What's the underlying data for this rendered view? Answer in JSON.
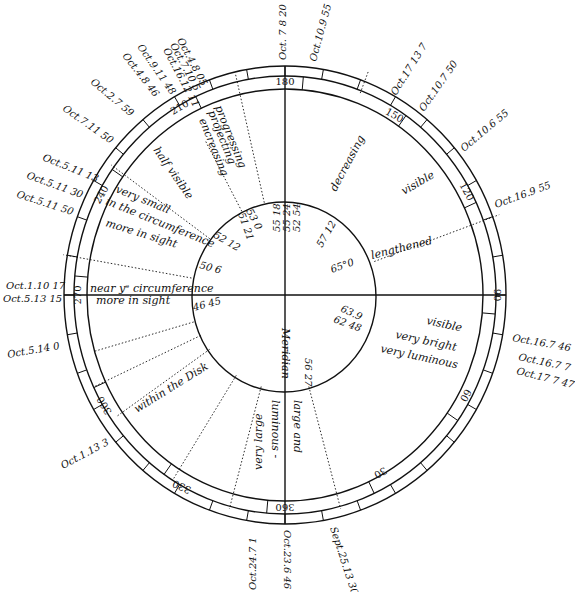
{
  "diagram": {
    "type": "circular observation chart",
    "colors": {
      "ink": "#111111",
      "background": "#ffffff"
    },
    "degree_marks": [
      {
        "label": "180",
        "x": 285,
        "y": 82,
        "rot": 0
      },
      {
        "label": "150",
        "x": 394,
        "y": 116,
        "rot": 30
      },
      {
        "label": "120",
        "x": 466,
        "y": 192,
        "rot": 62
      },
      {
        "label": "90",
        "x": 496,
        "y": 295,
        "rot": 90
      },
      {
        "label": "60",
        "x": 465,
        "y": 395,
        "rot": 118
      },
      {
        "label": "30",
        "x": 380,
        "y": 472,
        "rot": 150
      },
      {
        "label": "360",
        "x": 285,
        "y": 506,
        "rot": 180
      },
      {
        "label": "330",
        "x": 182,
        "y": 486,
        "rot": 205
      },
      {
        "label": "300",
        "x": 105,
        "y": 405,
        "rot": 240
      },
      {
        "label": "270",
        "x": 78,
        "y": 295,
        "rot": 270
      },
      {
        "label": "240",
        "x": 102,
        "y": 195,
        "rot": 300
      },
      {
        "label": "210",
        "x": 180,
        "y": 108,
        "rot": 330
      }
    ],
    "outer_dates": [
      {
        "text": "Oct. 7 8 20",
        "x": 286,
        "y": 60,
        "rot": -90
      },
      {
        "text": "Oct.10.9 55",
        "x": 316,
        "y": 62,
        "rot": -75
      },
      {
        "text": "Oct.17 13 7",
        "x": 396,
        "y": 96,
        "rot": -58
      },
      {
        "text": "Oct.10.7 50",
        "x": 424,
        "y": 112,
        "rot": -55
      },
      {
        "text": "Oct.10.6 55",
        "x": 464,
        "y": 152,
        "rot": -40
      },
      {
        "text": "Oct.16.9 55",
        "x": 496,
        "y": 208,
        "rot": -20
      },
      {
        "text": "Oct.16.7 46",
        "x": 512,
        "y": 341,
        "rot": 10
      },
      {
        "text": "Oct.16.7 7",
        "x": 518,
        "y": 360,
        "rot": 12
      },
      {
        "text": "Oct.17 7 47",
        "x": 516,
        "y": 374,
        "rot": 14
      },
      {
        "text": "Sept.25.13 30",
        "x": 330,
        "y": 528,
        "rot": 72
      },
      {
        "text": "Oct.23.6 46",
        "x": 284,
        "y": 530,
        "rot": 90
      },
      {
        "text": "Oct.24.7 1",
        "x": 256,
        "y": 590,
        "rot": -90
      },
      {
        "text": "Oct.1.13 3",
        "x": 63,
        "y": 469,
        "rot": -28
      },
      {
        "text": "Oct.5.14 0",
        "x": 8,
        "y": 358,
        "rot": -10
      },
      {
        "text": "Oct.5.13 15",
        "x": 3,
        "y": 302,
        "rot": 0
      },
      {
        "text": "Oct.1.10 17",
        "x": 6,
        "y": 289,
        "rot": 0
      },
      {
        "text": "Oct.5.11 50",
        "x": 16,
        "y": 197,
        "rot": 18
      },
      {
        "text": "Oct.5.11 30",
        "x": 26,
        "y": 178,
        "rot": 20
      },
      {
        "text": "Oct.5.11 13",
        "x": 42,
        "y": 160,
        "rot": 22
      },
      {
        "text": "Oct.7.11 50",
        "x": 62,
        "y": 110,
        "rot": 35
      },
      {
        "text": "Oct.2.7 59",
        "x": 90,
        "y": 83,
        "rot": 40
      },
      {
        "text": "Oct.4.8 46",
        "x": 122,
        "y": 56,
        "rot": 52
      },
      {
        "text": "Oct.9.11 48",
        "x": 137,
        "y": 47,
        "rot": 55
      },
      {
        "text": "Oct.4.8 05",
        "x": 177,
        "y": 40,
        "rot": 62
      },
      {
        "text": "Oct.7.10 5",
        "x": 170,
        "y": 45,
        "rot": 62
      },
      {
        "text": "Oct.16.12 11",
        "x": 163,
        "y": 50,
        "rot": 62
      }
    ],
    "inner_values": [
      {
        "text": "55 18",
        "x": 280,
        "y": 232,
        "rot": -90
      },
      {
        "text": "55 24",
        "x": 290,
        "y": 232,
        "rot": -90
      },
      {
        "text": "52 54",
        "x": 300,
        "y": 232,
        "rot": -90
      },
      {
        "text": "53 0",
        "x": 246,
        "y": 211,
        "rot": 62
      },
      {
        "text": "51 21",
        "x": 238,
        "y": 214,
        "rot": 70
      },
      {
        "text": "52 12",
        "x": 213,
        "y": 237,
        "rot": 30
      },
      {
        "text": "50 6",
        "x": 199,
        "y": 268,
        "rot": 15
      },
      {
        "text": "57 12",
        "x": 322,
        "y": 248,
        "rot": -60
      },
      {
        "text": "65°0",
        "x": 332,
        "y": 273,
        "rot": -20
      },
      {
        "text": "63.9",
        "x": 340,
        "y": 311,
        "rot": 25
      },
      {
        "text": "62 48",
        "x": 333,
        "y": 322,
        "rot": 20
      },
      {
        "text": "56 27",
        "x": 305,
        "y": 358,
        "rot": 90
      },
      {
        "text": "46 45",
        "x": 194,
        "y": 311,
        "rot": -15
      }
    ],
    "notes": [
      {
        "text": "progressing",
        "x": 215,
        "y": 107,
        "rot": 68
      },
      {
        "text": "projecting",
        "x": 208,
        "y": 112,
        "rot": 68
      },
      {
        "text": "encreasing",
        "x": 199,
        "y": 120,
        "rot": 68
      },
      {
        "text": "half visible",
        "x": 153,
        "y": 150,
        "rot": 55
      },
      {
        "text": "decreasing",
        "x": 336,
        "y": 192,
        "rot": -62
      },
      {
        "text": "visible",
        "x": 404,
        "y": 195,
        "rot": -30
      },
      {
        "text": "lengthened",
        "x": 372,
        "y": 259,
        "rot": -14
      },
      {
        "text": "very small",
        "x": 115,
        "y": 192,
        "rot": 22
      },
      {
        "text": "in the circumference",
        "x": 105,
        "y": 204,
        "rot": 22
      },
      {
        "text": "more in sight",
        "x": 105,
        "y": 226,
        "rot": 17
      },
      {
        "text": "near yᵉ circumference",
        "x": 90,
        "y": 292,
        "rot": 0
      },
      {
        "text": "more in sight",
        "x": 96,
        "y": 304,
        "rot": 0
      },
      {
        "text": "visible",
        "x": 426,
        "y": 324,
        "rot": 12
      },
      {
        "text": "very bright",
        "x": 395,
        "y": 338,
        "rot": 12
      },
      {
        "text": "very luminous",
        "x": 380,
        "y": 352,
        "rot": 12
      },
      {
        "text": "Meridian",
        "x": 282,
        "y": 328,
        "rot": 90
      },
      {
        "text": "large and",
        "x": 294,
        "y": 400,
        "rot": 90
      },
      {
        "text": "luminous -",
        "x": 272,
        "y": 400,
        "rot": 90
      },
      {
        "text": "very large",
        "x": 262,
        "y": 470,
        "rot": -90
      },
      {
        "text": "within the Disk",
        "x": 137,
        "y": 413,
        "rot": -32
      }
    ],
    "rays": [
      {
        "angle": 196,
        "from": 95,
        "to": 198
      },
      {
        "angle": 205,
        "from": 93,
        "to": 210
      },
      {
        "angle": 215,
        "from": 92,
        "to": 205
      },
      {
        "angle": 238,
        "from": 92,
        "to": 210
      },
      {
        "angle": 255,
        "from": 92,
        "to": 215
      },
      {
        "angle": 170,
        "from": 95,
        "to": 225
      },
      {
        "angle": 144,
        "from": 93,
        "to": 215
      },
      {
        "angle": 118,
        "from": 92,
        "to": 170
      },
      {
        "angle": 103,
        "from": 92,
        "to": 220
      },
      {
        "angle": 285,
        "from": 92,
        "to": 215
      },
      {
        "angle": 20,
        "from": 95,
        "to": 228
      },
      {
        "angle": 69,
        "from": 210,
        "to": 232
      }
    ]
  }
}
